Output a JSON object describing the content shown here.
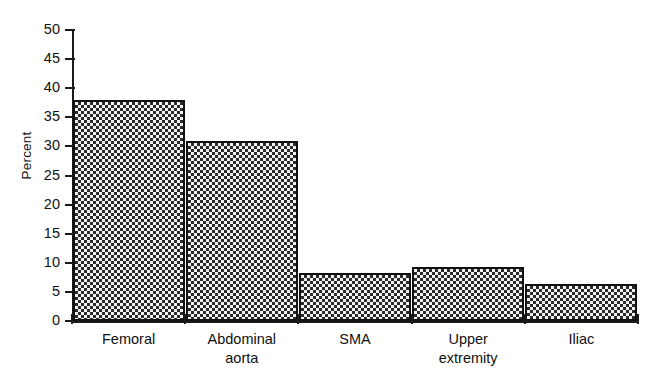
{
  "chart_data": {
    "type": "bar",
    "title": "",
    "xlabel": "",
    "ylabel": "Percent",
    "ylim": [
      0,
      50
    ],
    "ytick_step": 5,
    "grid": false,
    "legend": "none",
    "categories": [
      "Femoral",
      "Abdominal\naorta",
      "SMA",
      "Upper\nextremity",
      "Iliac"
    ],
    "values": [
      38,
      31,
      8.3,
      9.2,
      6.4
    ],
    "yticks": [
      "50",
      "45",
      "40",
      "35",
      "30",
      "25",
      "20",
      "15",
      "10",
      "5",
      "0"
    ],
    "bar_fill_pattern": "checkerboard",
    "bar_edge_color": "#111111",
    "axis_color": "#1a1a1a",
    "background_color": "#ffffff"
  },
  "bars": [
    {
      "label": "Femoral",
      "value": 38,
      "label_lines": "Femoral"
    },
    {
      "label": "Abdominal aorta",
      "value": 31,
      "label_lines": "Abdominal\naorta"
    },
    {
      "label": "SMA",
      "value": 8.3,
      "label_lines": "SMA"
    },
    {
      "label": "Upper extremity",
      "value": 9.2,
      "label_lines": "Upper\nextremity"
    },
    {
      "label": "Iliac",
      "value": 6.4,
      "label_lines": "Iliac"
    }
  ]
}
